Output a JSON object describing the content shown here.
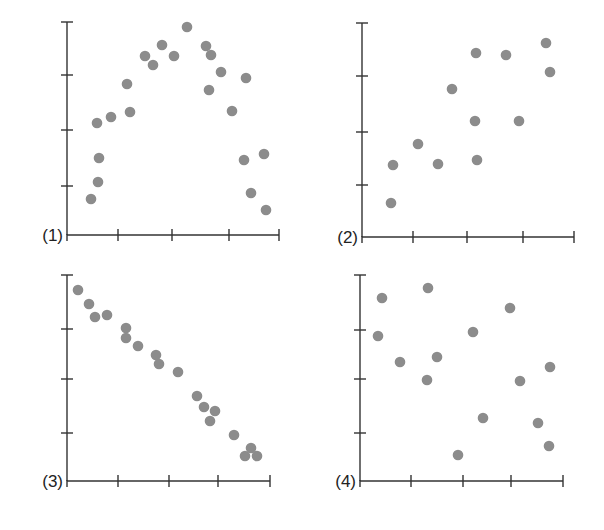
{
  "chart_data": [
    {
      "type": "scatter",
      "title": "(1)",
      "label": "(1)",
      "xlabel": "",
      "ylabel": "",
      "grid": false,
      "xlim": [
        0,
        4
      ],
      "ylim": [
        0,
        4
      ],
      "note": "Inverted-U (nonlinear) relationship",
      "frame": {
        "x0": 67,
        "y0": 235,
        "x1": 279,
        "y1": 22
      },
      "xticks_px": [
        67,
        118,
        172,
        229,
        279
      ],
      "yticks_px": [
        22,
        75,
        130,
        186
      ],
      "points_px": [
        [
          91,
          199
        ],
        [
          98,
          182
        ],
        [
          99,
          158
        ],
        [
          97,
          123
        ],
        [
          111,
          117
        ],
        [
          127,
          84
        ],
        [
          130,
          112
        ],
        [
          145,
          56
        ],
        [
          153,
          65
        ],
        [
          162,
          45
        ],
        [
          174,
          56
        ],
        [
          187,
          27
        ],
        [
          206,
          46
        ],
        [
          211,
          55
        ],
        [
          209,
          90
        ],
        [
          221,
          72
        ],
        [
          232,
          111
        ],
        [
          246,
          78
        ],
        [
          244,
          160
        ],
        [
          251,
          193
        ],
        [
          264,
          154
        ],
        [
          266,
          210
        ]
      ]
    },
    {
      "type": "scatter",
      "title": "(2)",
      "label": "(2)",
      "xlabel": "",
      "ylabel": "",
      "grid": false,
      "xlim": [
        0,
        4
      ],
      "ylim": [
        0,
        4
      ],
      "note": "Moderate positive correlation",
      "frame": {
        "x0": 362,
        "y0": 237,
        "x1": 574,
        "y1": 23
      },
      "xticks_px": [
        362,
        413,
        467,
        523,
        574
      ],
      "yticks_px": [
        23,
        76,
        132,
        185
      ],
      "points_px": [
        [
          391,
          203
        ],
        [
          393,
          165
        ],
        [
          418,
          144
        ],
        [
          438,
          164
        ],
        [
          452,
          89
        ],
        [
          476,
          53
        ],
        [
          475,
          121
        ],
        [
          477,
          160
        ],
        [
          506,
          55
        ],
        [
          519,
          121
        ],
        [
          546,
          43
        ],
        [
          550,
          72
        ]
      ]
    },
    {
      "type": "scatter",
      "title": "(3)",
      "label": "(3)",
      "xlabel": "",
      "ylabel": "",
      "grid": false,
      "xlim": [
        0,
        4
      ],
      "ylim": [
        0,
        4
      ],
      "note": "Strong negative linear correlation",
      "frame": {
        "x0": 67,
        "y0": 481,
        "x1": 270,
        "y1": 275
      },
      "xticks_px": [
        67,
        118,
        169,
        218,
        270
      ],
      "yticks_px": [
        275,
        329,
        379,
        433
      ],
      "points_px": [
        [
          78,
          290
        ],
        [
          89,
          304
        ],
        [
          95,
          317
        ],
        [
          107,
          315
        ],
        [
          126,
          328
        ],
        [
          126,
          338
        ],
        [
          138,
          346
        ],
        [
          156,
          355
        ],
        [
          159,
          364
        ],
        [
          178,
          372
        ],
        [
          197,
          396
        ],
        [
          204,
          407
        ],
        [
          210,
          421
        ],
        [
          215,
          411
        ],
        [
          234,
          435
        ],
        [
          245,
          456
        ],
        [
          251,
          448
        ],
        [
          257,
          456
        ]
      ]
    },
    {
      "type": "scatter",
      "title": "(4)",
      "label": "(4)",
      "xlabel": "",
      "ylabel": "",
      "grid": false,
      "xlim": [
        0,
        4
      ],
      "ylim": [
        0,
        4
      ],
      "note": "No apparent correlation",
      "frame": {
        "x0": 360,
        "y0": 481,
        "x1": 563,
        "y1": 275
      },
      "xticks_px": [
        360,
        411,
        463,
        511,
        563
      ],
      "yticks_px": [
        275,
        330,
        379,
        433
      ],
      "points_px": [
        [
          382,
          298
        ],
        [
          428,
          288
        ],
        [
          378,
          336
        ],
        [
          400,
          362
        ],
        [
          437,
          357
        ],
        [
          427,
          380
        ],
        [
          473,
          332
        ],
        [
          510,
          308
        ],
        [
          483,
          418
        ],
        [
          520,
          381
        ],
        [
          550,
          367
        ],
        [
          458,
          455
        ],
        [
          538,
          423
        ],
        [
          549,
          446
        ]
      ]
    }
  ],
  "labels": {
    "p1": "(1)",
    "p2": "(2)",
    "p3": "(3)",
    "p4": "(4)"
  },
  "colors": {
    "dot": "#8c8c8c",
    "axis": "#333333",
    "background": "#ffffff"
  }
}
